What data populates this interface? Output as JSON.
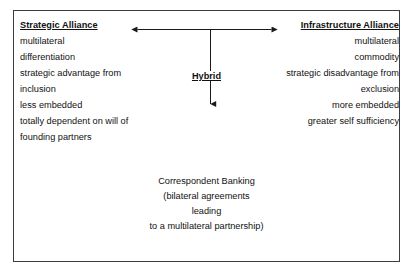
{
  "diagram": {
    "type": "two-pole-spectrum-diagram",
    "border_color": "#3d3d3d",
    "text_color": "#111111",
    "left_column": {
      "heading": "Strategic Alliance",
      "items": [
        "multilateral",
        "differentiation",
        "strategic advantage from",
        "inclusion",
        "less embedded",
        "totally dependent on will of",
        "founding partners"
      ]
    },
    "right_column": {
      "heading": "Infrastructure Alliance",
      "items": [
        "multilateral",
        "commodity",
        "strategic disadvantage from",
        "exclusion",
        "more embedded",
        "greater self sufficiency"
      ]
    },
    "center": {
      "hybrid_label": "Hybrid",
      "horizontal_arrow": "double-headed-horizontal-arrow",
      "vertical_arrow": "down-arrow"
    },
    "bottom_block": {
      "lines": [
        "Correspondent Banking",
        "(bilateral agreements",
        "leading",
        "to a multilateral partnership)"
      ]
    }
  }
}
